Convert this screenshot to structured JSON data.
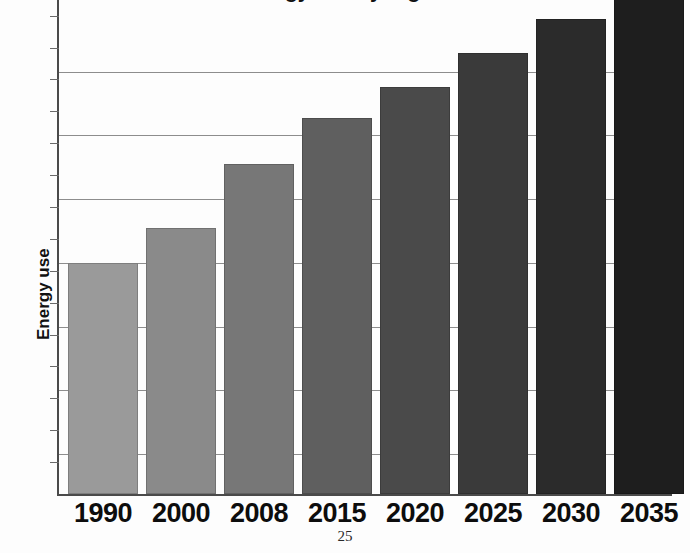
{
  "page": {
    "page_number": "25",
    "background_color": "#fdfdfd"
  },
  "chart_title_partial": "Energy use by region",
  "axis": {
    "y_title": "Energy use",
    "axis_color": "#4a4a4a",
    "gridline_color": "#8d8d8d"
  },
  "chart_data": {
    "type": "bar",
    "title": "Energy use by region",
    "xlabel": "",
    "ylabel": "Energy use",
    "grid": true,
    "legend": "none",
    "categories": [
      "1990",
      "2000",
      "2008",
      "2015",
      "2020",
      "2025",
      "2030",
      "2035"
    ],
    "values": [
      232,
      267,
      331,
      377,
      408,
      443,
      477,
      520
    ],
    "ylim": [
      0,
      556
    ],
    "y_tick_labels": [],
    "gridline_values": [
      40,
      104,
      168,
      232,
      296,
      360,
      424
    ],
    "bar_colors": [
      "#9a9a9a",
      "#8a8a8a",
      "#777777",
      "#5f5f5f",
      "#4a4a4a",
      "#3a3a3a",
      "#2b2b2b",
      "#1e1e1e"
    ],
    "note": "Top of chart and title are cropped off the top edge of the page; last bar extends beyond the visible plot area."
  },
  "bars": [
    {
      "label": "1990",
      "value": 232,
      "color": "#9a9a9a"
    },
    {
      "label": "2000",
      "value": 267,
      "color": "#8a8a8a"
    },
    {
      "label": "2008",
      "value": 331,
      "color": "#777777"
    },
    {
      "label": "2015",
      "value": 377,
      "color": "#5f5f5f"
    },
    {
      "label": "2020",
      "value": 408,
      "color": "#4a4a4a"
    },
    {
      "label": "2025",
      "value": 443,
      "color": "#3a3a3a"
    },
    {
      "label": "2030",
      "value": 477,
      "color": "#2b2b2b"
    },
    {
      "label": "2035",
      "value": 520,
      "color": "#1e1e1e"
    }
  ]
}
